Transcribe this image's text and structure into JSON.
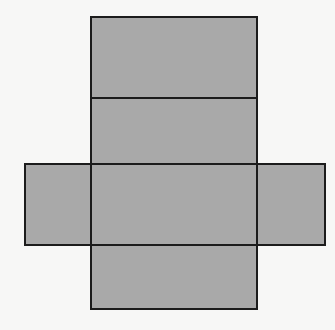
{
  "diagram": {
    "type": "net-of-rectangular-prism",
    "colors": {
      "background": "#f7f7f6",
      "face_fill": "#a9a9a9",
      "edge": "#1c1c1c"
    },
    "edge_width": 2,
    "faces": [
      {
        "id": "top-flap",
        "x": 90,
        "y": 16,
        "w": 168,
        "h": 83
      },
      {
        "id": "upper-face",
        "x": 90,
        "y": 97,
        "w": 168,
        "h": 68
      },
      {
        "id": "left-flap",
        "x": 24,
        "y": 163,
        "w": 68,
        "h": 83
      },
      {
        "id": "center-face",
        "x": 90,
        "y": 163,
        "w": 168,
        "h": 83
      },
      {
        "id": "right-flap",
        "x": 256,
        "y": 163,
        "w": 70,
        "h": 83
      },
      {
        "id": "bottom-face",
        "x": 90,
        "y": 244,
        "w": 168,
        "h": 66
      }
    ]
  }
}
